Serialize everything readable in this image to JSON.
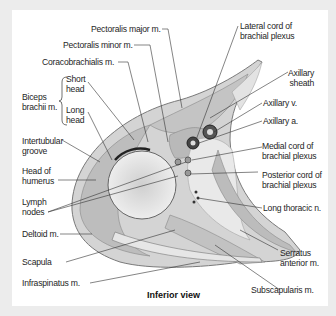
{
  "figure": {
    "caption": "Inferior view",
    "labels_left": {
      "pectoralis_major": "Pectoralis major m.",
      "pectoralis_minor": "Pectoralis minor m.",
      "coracobrachialis": "Coracobrachialis m.",
      "biceps_line1": "Biceps",
      "biceps_line2": "brachii m.",
      "short_head_1": "Short",
      "short_head_2": "head",
      "long_head_1": "Long",
      "long_head_2": "head",
      "intertubular_1": "Intertubular",
      "intertubular_2": "groove",
      "head_humerus_1": "Head of",
      "head_humerus_2": "humerus",
      "lymph_1": "Lymph",
      "lymph_2": "nodes",
      "deltoid": "Deltoid m.",
      "scapula": "Scapula",
      "infraspinatus": "Infraspinatus m."
    },
    "labels_right": {
      "lateral_cord_1": "Lateral cord of",
      "lateral_cord_2": "brachial plexus",
      "axillary_sheath_1": "Axillary",
      "axillary_sheath_2": "sheath",
      "axillary_v": "Axillary v.",
      "axillary_a": "Axillary a.",
      "medial_cord_1": "Medial cord of",
      "medial_cord_2": "brachial plexus",
      "posterior_cord_1": "Posterior cord of",
      "posterior_cord_2": "brachial plexus",
      "long_thoracic": "Long thoracic n.",
      "serratus_1": "Serratus",
      "serratus_2": "anterior m.",
      "subscapularis": "Subscapularis m."
    }
  }
}
